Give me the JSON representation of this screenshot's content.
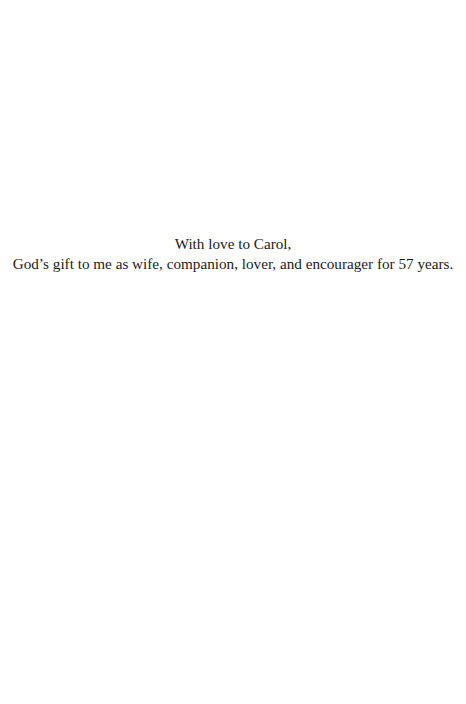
{
  "page": {
    "type": "dedication",
    "lines": [
      "With love to Carol,",
      "God’s gift to me as wife, companion, lover, and encourager for 57 years."
    ]
  }
}
